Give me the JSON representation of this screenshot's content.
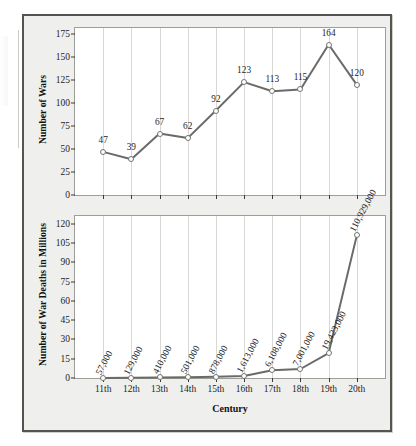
{
  "chart_data": [
    {
      "type": "line",
      "panel": "top",
      "title": "",
      "xlabel": "",
      "ylabel": "Number of Wars",
      "categories": [
        "11th",
        "12th",
        "13th",
        "14th",
        "15th",
        "16th",
        "17th",
        "18th",
        "19th",
        "20th"
      ],
      "values": [
        47,
        39,
        67,
        62,
        92,
        123,
        113,
        115,
        164,
        120
      ],
      "point_labels": [
        "47",
        "39",
        "67",
        "62",
        "92",
        "123",
        "113",
        "115",
        "164",
        "120"
      ],
      "yticks": [
        0,
        25,
        50,
        75,
        100,
        125,
        150,
        175
      ],
      "ylim": [
        0,
        182
      ],
      "grid": "vertical",
      "legend": "none",
      "line_color": "#6a6a68",
      "marker_fill": "#ffffff",
      "marker_edge": "#737370"
    },
    {
      "type": "line",
      "panel": "bottom",
      "title": "",
      "xlabel": "Century",
      "ylabel": "Number of War Deaths in Millions",
      "categories": [
        "11th",
        "12th",
        "13th",
        "14th",
        "15th",
        "16th",
        "17th",
        "18th",
        "19th",
        "20th"
      ],
      "values": [
        0.057,
        0.129,
        0.41,
        0.501,
        0.878,
        1.613,
        6.108,
        7.001,
        19.423,
        110.929
      ],
      "point_labels": [
        "57,000",
        "129,000",
        "410,000",
        "501,000",
        "878,000",
        "1,613,000",
        "6,108,000",
        "7,001,000",
        "19,423,000",
        "110,929,000"
      ],
      "yticks": [
        0,
        15,
        30,
        45,
        60,
        75,
        90,
        105,
        120
      ],
      "ylim": [
        0,
        126
      ],
      "grid": "vertical",
      "legend": "none",
      "line_color": "#6a6a68",
      "marker_fill": "#ffffff",
      "marker_edge": "#737370"
    }
  ],
  "figure": {
    "frame_color": "#56544f",
    "background": "#efefed",
    "plot_background": "#ffffff",
    "gridline_color": "#d8d8d6"
  }
}
